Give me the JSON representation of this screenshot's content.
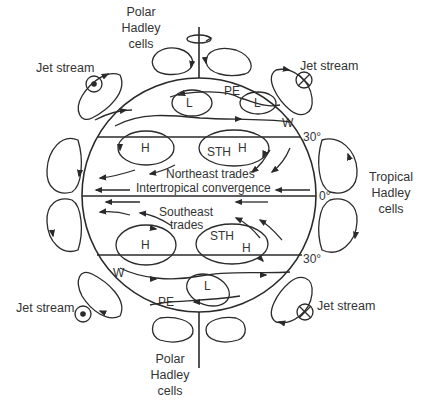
{
  "diagram": {
    "labels": {
      "polar_top": [
        "Polar",
        "Hadley",
        "cells"
      ],
      "polar_bottom": [
        "Polar",
        "Hadley",
        "cells"
      ],
      "tropical": [
        "Tropical",
        "Hadley",
        "cells"
      ],
      "jet_nw": "Jet stream",
      "jet_ne": "Jet stream",
      "jet_sw": "Jet stream",
      "jet_se": "Jet stream",
      "pe_n": "PE",
      "pe_s": "PE",
      "w_n": "W",
      "w_s": "W",
      "l_n1": "L",
      "l_n2": "L",
      "l_s": "L",
      "h_n1": "H",
      "h_n2": "H",
      "sth_n": "STH",
      "h_s1": "H",
      "h_s2": "H",
      "sth_s": "STH",
      "ne_trades": "Northeast trades",
      "itcz": "Intertropical convergence",
      "se_trades_1": "Southeast",
      "se_trades_2": "trades",
      "lat_30n": "30°",
      "lat_0": "0°",
      "lat_30s": "30°"
    }
  }
}
